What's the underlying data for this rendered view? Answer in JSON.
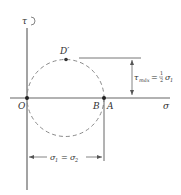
{
  "diagram": {
    "type": "mohr-circle",
    "axes": {
      "vertical_label": "τ",
      "horizontal_label": "σ"
    },
    "points": {
      "origin": "O",
      "b": "B",
      "a": "A",
      "top": "D′"
    },
    "tau_max": {
      "lhs": "τ",
      "lhs_sub": "máx",
      "eq": "=",
      "frac_num": "1",
      "frac_den": "2",
      "rhs": "σ",
      "rhs_sub": "1"
    },
    "dimension": {
      "lhs": "σ",
      "lhs_sub": "1",
      "eq": "=",
      "rhs": "σ",
      "rhs_sub": "2"
    },
    "colors": {
      "line": "#555555",
      "circle": "#8a8a8a",
      "text": "#333333"
    }
  }
}
